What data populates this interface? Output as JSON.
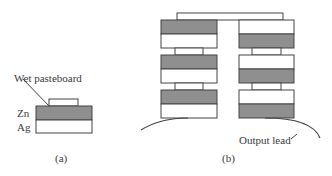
{
  "figure": {
    "panel_a": {
      "caption": "(a)",
      "labels": {
        "pasteboard": "Wet pasteboard",
        "zn": "Zn",
        "ag": "Ag"
      }
    },
    "panel_b": {
      "caption": "(b)",
      "labels": {
        "output_lead": "Output lead"
      },
      "left_stack": [
        "Zn/Ag",
        "Zn/Ag",
        "Zn/Ag"
      ],
      "right_stack": [
        "Ag/Zn",
        "Ag/Zn",
        "Ag/Zn"
      ]
    },
    "colors": {
      "zn_fill": "#8f8f8f",
      "ag_fill": "#ffffff",
      "stroke": "#444444"
    }
  }
}
